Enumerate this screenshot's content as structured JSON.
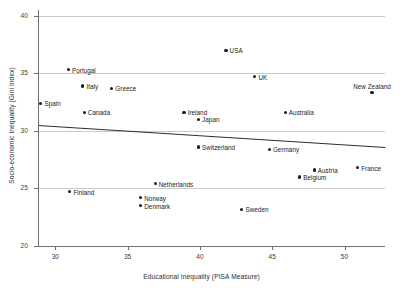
{
  "chart_data": {
    "type": "scatter",
    "title": "",
    "xlabel": "Educational Inequality (PISA Measure)",
    "ylabel": "Socio-economic Inequality (Gini Index)",
    "xlim": [
      28.8,
      52.8
    ],
    "ylim": [
      20,
      40.5
    ],
    "xticks": [
      30,
      35,
      40,
      45,
      50
    ],
    "yticks": [
      20,
      25,
      30,
      35,
      40
    ],
    "xtick_labels": [
      "30",
      "35",
      "40",
      "45",
      "50"
    ],
    "ytick_labels": [
      "20",
      "25",
      "30",
      "35",
      "40"
    ],
    "grid": "horizontal",
    "legend": "none",
    "point_color": "#1a1a1c",
    "grid_color": "#c9c9cc",
    "axis_color": "#6e6e73",
    "trendline_color": "#2e2e31",
    "points": [
      {
        "label": "Spain",
        "x": 29.0,
        "y": 32.4,
        "pos": "right"
      },
      {
        "label": "Portugal",
        "x": 30.9,
        "y": 35.3,
        "pos": "right"
      },
      {
        "label": "Finland",
        "x": 31.0,
        "y": 24.7,
        "pos": "right"
      },
      {
        "label": "Italy",
        "x": 31.9,
        "y": 33.9,
        "pos": "right"
      },
      {
        "label": "Canada",
        "x": 32.0,
        "y": 31.6,
        "pos": "right"
      },
      {
        "label": "Greece",
        "x": 33.9,
        "y": 33.7,
        "pos": "right"
      },
      {
        "label": "Norway",
        "x": 35.9,
        "y": 24.2,
        "pos": "right"
      },
      {
        "label": "Denmark",
        "x": 35.9,
        "y": 23.5,
        "pos": "right"
      },
      {
        "label": "Netherlands",
        "x": 36.9,
        "y": 25.4,
        "pos": "right"
      },
      {
        "label": "Ireland",
        "x": 38.9,
        "y": 31.6,
        "pos": "right"
      },
      {
        "label": "Japan",
        "x": 39.9,
        "y": 31.0,
        "pos": "right"
      },
      {
        "label": "Switzerland",
        "x": 39.9,
        "y": 28.6,
        "pos": "right"
      },
      {
        "label": "USA",
        "x": 41.8,
        "y": 37.0,
        "pos": "right"
      },
      {
        "label": "Sweden",
        "x": 42.9,
        "y": 23.2,
        "pos": "right"
      },
      {
        "label": "UK",
        "x": 43.8,
        "y": 34.7,
        "pos": "right"
      },
      {
        "label": "Germany",
        "x": 44.8,
        "y": 28.4,
        "pos": "right"
      },
      {
        "label": "Australia",
        "x": 45.9,
        "y": 31.6,
        "pos": "right"
      },
      {
        "label": "Belgium",
        "x": 46.9,
        "y": 26.0,
        "pos": "right"
      },
      {
        "label": "Austria",
        "x": 47.9,
        "y": 26.6,
        "pos": "right"
      },
      {
        "label": "France",
        "x": 50.9,
        "y": 26.8,
        "pos": "right"
      },
      {
        "label": "New Zealand",
        "x": 51.9,
        "y": 33.3,
        "pos": "above"
      }
    ],
    "trendline": {
      "x1": 28.8,
      "y1": 30.5,
      "x2": 52.8,
      "y2": 28.6
    }
  }
}
